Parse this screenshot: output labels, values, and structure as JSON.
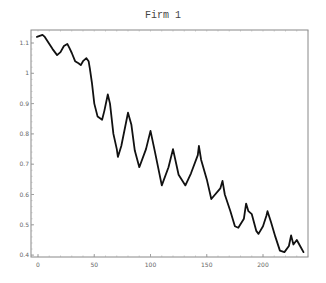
{
  "chart_data": {
    "type": "line",
    "title": "Firm 1",
    "xlabel": "",
    "ylabel": "",
    "xlim": [
      -5,
      243
    ],
    "ylim": [
      0.395,
      1.145
    ],
    "x_ticks": [
      "0",
      "50",
      "100",
      "150",
      "200"
    ],
    "y_ticks": [
      "0.4",
      "0.5",
      "0.6",
      "0.7",
      "0.8",
      "0.9",
      "1",
      "1.1"
    ],
    "grid": false,
    "legend": null,
    "series": [
      {
        "name": "Firm 1",
        "color": "#111111",
        "points": [
          [
            -1,
            1.12
          ],
          [
            4,
            1.127
          ],
          [
            6,
            1.12
          ],
          [
            13,
            1.08
          ],
          [
            17,
            1.06
          ],
          [
            20,
            1.07
          ],
          [
            23,
            1.09
          ],
          [
            26,
            1.097
          ],
          [
            28,
            1.083
          ],
          [
            30,
            1.067
          ],
          [
            33,
            1.04
          ],
          [
            36,
            1.033
          ],
          [
            38,
            1.027
          ],
          [
            40,
            1.04
          ],
          [
            43,
            1.05
          ],
          [
            45,
            1.04
          ],
          [
            46,
            1.017
          ],
          [
            48,
            0.967
          ],
          [
            50,
            0.9
          ],
          [
            53,
            0.857
          ],
          [
            57,
            0.847
          ],
          [
            59,
            0.877
          ],
          [
            62,
            0.93
          ],
          [
            64,
            0.9
          ],
          [
            67,
            0.8
          ],
          [
            70,
            0.75
          ],
          [
            71,
            0.724
          ],
          [
            74,
            0.76
          ],
          [
            80,
            0.87
          ],
          [
            83,
            0.83
          ],
          [
            86,
            0.745
          ],
          [
            90,
            0.69
          ],
          [
            96,
            0.75
          ],
          [
            100,
            0.81
          ],
          [
            104,
            0.74
          ],
          [
            110,
            0.63
          ],
          [
            116,
            0.69
          ],
          [
            120,
            0.75
          ],
          [
            125,
            0.665
          ],
          [
            131,
            0.63
          ],
          [
            136,
            0.67
          ],
          [
            142,
            0.73
          ],
          [
            143,
            0.76
          ],
          [
            145,
            0.715
          ],
          [
            150,
            0.65
          ],
          [
            154,
            0.585
          ],
          [
            162,
            0.62
          ],
          [
            164,
            0.645
          ],
          [
            166,
            0.6
          ],
          [
            171,
            0.545
          ],
          [
            175,
            0.495
          ],
          [
            178,
            0.49
          ],
          [
            183,
            0.52
          ],
          [
            185,
            0.57
          ],
          [
            187,
            0.545
          ],
          [
            190,
            0.535
          ],
          [
            194,
            0.48
          ],
          [
            196,
            0.47
          ],
          [
            200,
            0.495
          ],
          [
            203,
            0.53
          ],
          [
            204,
            0.545
          ],
          [
            207,
            0.51
          ],
          [
            211,
            0.46
          ],
          [
            215,
            0.415
          ],
          [
            219,
            0.41
          ],
          [
            223,
            0.43
          ],
          [
            225,
            0.465
          ],
          [
            227,
            0.435
          ],
          [
            230,
            0.45
          ],
          [
            233,
            0.43
          ],
          [
            236,
            0.41
          ]
        ]
      }
    ]
  }
}
